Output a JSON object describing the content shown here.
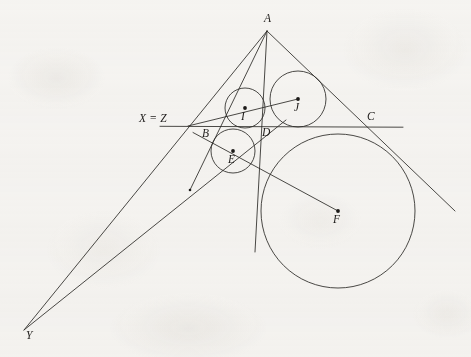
{
  "figure": {
    "background_color": "#f7f6f4",
    "stroke_color": "#2b2926",
    "labels": {
      "A": "A",
      "B": "B",
      "C": "C",
      "D": "D",
      "E": "E",
      "F": "F",
      "I": "I",
      "J": "J",
      "Y": "Y",
      "XZ": "X = Z"
    },
    "points": [
      {
        "name": "A",
        "x": 267,
        "y": 31,
        "label": "A",
        "label_x": 264,
        "label_y": 14,
        "dot": false
      },
      {
        "name": "Z",
        "x": 188,
        "y": 126,
        "label": "X = Z",
        "label_x": 139,
        "label_y": 114,
        "dot": false
      },
      {
        "name": "B",
        "x": 204,
        "y": 130,
        "label": "B",
        "label_x": 203,
        "label_y": 129,
        "dot": false
      },
      {
        "name": "C",
        "x": 379,
        "y": 127,
        "label": "C",
        "label_x": 368,
        "label_y": 113,
        "dot": false
      },
      {
        "name": "D",
        "x": 260,
        "y": 127,
        "label": "D",
        "label_x": 263,
        "label_y": 128,
        "dot": false
      },
      {
        "name": "E",
        "x": 233,
        "y": 151,
        "label": "E",
        "label_x": 229,
        "label_y": 155,
        "dot": true
      },
      {
        "name": "F",
        "x": 338,
        "y": 211,
        "label": "F",
        "label_x": 334,
        "label_y": 215,
        "dot": true
      },
      {
        "name": "I",
        "x": 245,
        "y": 108,
        "label": "I",
        "label_x": 242,
        "label_y": 112,
        "dot": true
      },
      {
        "name": "J",
        "x": 298,
        "y": 99,
        "label": "J",
        "label_x": 295,
        "label_y": 103,
        "dot": true
      },
      {
        "name": "Y",
        "x": 24,
        "y": 330,
        "label": "Y",
        "label_x": 27,
        "label_y": 331,
        "dot": false
      }
    ],
    "circles": [
      {
        "name": "incircle-I",
        "cx": 245,
        "cy": 108,
        "r": 20
      },
      {
        "name": "excircle-J",
        "cx": 298,
        "cy": 99,
        "r": 28
      },
      {
        "name": "excircle-E",
        "cx": 233,
        "cy": 151,
        "r": 22
      },
      {
        "name": "excircle-F",
        "cx": 338,
        "cy": 211,
        "r": 77
      }
    ],
    "segments": [
      {
        "name": "line-AY",
        "x1": 267,
        "y1": 31,
        "x2": 24,
        "y2": 330
      },
      {
        "name": "line-AC-extended",
        "x1": 267,
        "y1": 31,
        "x2": 455,
        "y2": 211
      },
      {
        "name": "line-A-vertical",
        "x1": 267,
        "y1": 31,
        "x2": 255,
        "y2": 252
      },
      {
        "name": "line-A-through-B",
        "x1": 267,
        "y1": 31,
        "x2": 190,
        "y2": 190
      },
      {
        "name": "line-YB-extended",
        "x1": 24,
        "y1": 330,
        "x2": 286,
        "y2": 120
      },
      {
        "name": "line-horizontal-XZC",
        "x1": 160,
        "y1": 126,
        "x2": 403,
        "y2": 127
      },
      {
        "name": "line-ZJ",
        "x1": 188,
        "y1": 126,
        "x2": 298,
        "y2": 99
      },
      {
        "name": "line-BF",
        "x1": 193,
        "y1": 133,
        "x2": 338,
        "y2": 211
      }
    ]
  }
}
